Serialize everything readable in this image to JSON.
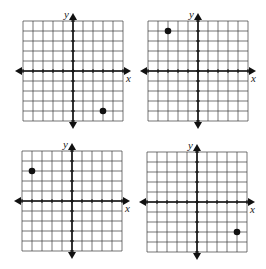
{
  "chart_data": [
    {
      "type": "scatter",
      "title": "",
      "xlabel": "x",
      "ylabel": "y",
      "xlim": [
        -5,
        5
      ],
      "ylim": [
        -5,
        5
      ],
      "grid": true,
      "grid_step": 1,
      "legend": null,
      "points": [
        {
          "x": 3,
          "y": -4
        }
      ],
      "layout": {
        "left": 23,
        "top": 21,
        "size": 100
      }
    },
    {
      "type": "scatter",
      "title": "",
      "xlabel": "x",
      "ylabel": "y",
      "xlim": [
        -5,
        5
      ],
      "ylim": [
        -5,
        5
      ],
      "grid": true,
      "grid_step": 1,
      "legend": null,
      "points": [
        {
          "x": -3,
          "y": 4
        }
      ],
      "layout": {
        "left": 148,
        "top": 21,
        "size": 100
      }
    },
    {
      "type": "scatter",
      "title": "",
      "xlabel": "x",
      "ylabel": "y",
      "xlim": [
        -5,
        5
      ],
      "ylim": [
        -5,
        5
      ],
      "grid": true,
      "grid_step": 1,
      "legend": null,
      "points": [
        {
          "x": -4,
          "y": 3
        }
      ],
      "layout": {
        "left": 22,
        "top": 151,
        "size": 100
      }
    },
    {
      "type": "scatter",
      "title": "",
      "xlabel": "x",
      "ylabel": "y",
      "xlim": [
        -5,
        5
      ],
      "ylim": [
        -5,
        5
      ],
      "grid": true,
      "grid_step": 1,
      "legend": null,
      "points": [
        {
          "x": 4,
          "y": -3
        }
      ],
      "layout": {
        "left": 147,
        "top": 152,
        "size": 100
      }
    }
  ],
  "labels": {
    "x_axis": "x",
    "y_axis": "y"
  },
  "colors": {
    "grid": "#3a3a3a",
    "axis": "#111111",
    "point": "#111111",
    "background": "#ffffff"
  }
}
